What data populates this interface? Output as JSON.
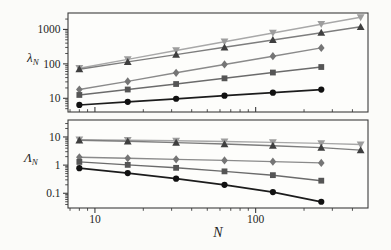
{
  "figure": {
    "background": "#fbfbf9",
    "frame_color": "#3c3c3c",
    "tick_color": "#3c3c3c",
    "text_color": "#1f1f1f"
  },
  "labels": {
    "top_y_symbol": "λ",
    "top_y_sub": "N",
    "bottom_y_symbol": "Λ",
    "bottom_y_sub": "N",
    "x_label": "N"
  },
  "chart_data": [
    {
      "type": "line",
      "panel": "top",
      "title": "",
      "xlabel": "",
      "ylabel": "lambda_N",
      "xscale": "log",
      "yscale": "log",
      "xlim": [
        6.8,
        500
      ],
      "ylim": [
        4,
        3000
      ],
      "grid": false,
      "legend": "none",
      "x_major_ticks": [
        10,
        100
      ],
      "x_tick_labels": [
        "",
        ""
      ],
      "x_tick_side": "in",
      "y_major_ticks": [
        10,
        100,
        1000
      ],
      "y_tick_labels": [
        "10",
        "100",
        "1000"
      ],
      "series": [
        {
          "name": "triangle-down-series",
          "marker": "triangle-down",
          "line_color": "#a8a8a8",
          "marker_color": "#9d9d9d",
          "x": [
            8,
            16,
            32,
            64,
            128,
            256,
            450
          ],
          "y": [
            75,
            135,
            245,
            440,
            790,
            1420,
            2250
          ]
        },
        {
          "name": "triangle-up-series",
          "marker": "triangle-up",
          "line_color": "#7d7d7d",
          "marker_color": "#3f3f3f",
          "x": [
            8,
            16,
            32,
            64,
            128,
            256,
            450
          ],
          "y": [
            70,
            114,
            186,
            303,
            494,
            806,
            1190
          ]
        },
        {
          "name": "diamond-series",
          "marker": "diamond",
          "line_color": "#8a8a8a",
          "marker_color": "#757575",
          "x": [
            8,
            16,
            32,
            64,
            128,
            256
          ],
          "y": [
            18,
            31,
            55,
            96,
            167,
            290
          ]
        },
        {
          "name": "square-series",
          "marker": "square",
          "line_color": "#6b6b6b",
          "marker_color": "#555555",
          "x": [
            8,
            16,
            32,
            64,
            128,
            256
          ],
          "y": [
            12.5,
            18,
            26,
            38,
            56,
            81
          ]
        },
        {
          "name": "circle-series",
          "marker": "circle",
          "line_color": "#1c1c1c",
          "marker_color": "#111111",
          "x": [
            8,
            16,
            32,
            64,
            128,
            256
          ],
          "y": [
            6.4,
            7.9,
            9.7,
            11.9,
            14.6,
            17.9
          ]
        }
      ]
    },
    {
      "type": "line",
      "panel": "bottom",
      "title": "",
      "xlabel": "N",
      "ylabel": "Lambda_N",
      "xscale": "log",
      "yscale": "log",
      "xlim": [
        6.8,
        500
      ],
      "ylim": [
        0.03,
        40
      ],
      "grid": false,
      "legend": "none",
      "x_major_ticks": [
        10,
        100
      ],
      "x_tick_labels": [
        "10",
        "100"
      ],
      "x_tick_side": "out",
      "y_major_ticks": [
        0.1,
        1,
        10
      ],
      "y_tick_labels": [
        "0.1",
        "1",
        "10"
      ],
      "series": [
        {
          "name": "triangle-down-series",
          "marker": "triangle-down",
          "line_color": "#a8a8a8",
          "marker_color": "#9d9d9d",
          "x": [
            8,
            16,
            32,
            64,
            128,
            256,
            450
          ],
          "y": [
            8.0,
            7.7,
            7.3,
            6.9,
            6.4,
            5.9,
            5.4
          ]
        },
        {
          "name": "triangle-up-series",
          "marker": "triangle-up",
          "line_color": "#7d7d7d",
          "marker_color": "#3f3f3f",
          "x": [
            8,
            16,
            32,
            64,
            128,
            256,
            450
          ],
          "y": [
            7.6,
            7.0,
            6.3,
            5.6,
            4.9,
            4.2,
            3.4
          ]
        },
        {
          "name": "diamond-series",
          "marker": "diamond",
          "line_color": "#8a8a8a",
          "marker_color": "#757575",
          "x": [
            8,
            16,
            32,
            64,
            128,
            256
          ],
          "y": [
            1.9,
            1.75,
            1.6,
            1.47,
            1.33,
            1.2
          ]
        },
        {
          "name": "square-series",
          "marker": "square",
          "line_color": "#6b6b6b",
          "marker_color": "#555555",
          "x": [
            8,
            16,
            32,
            64,
            128,
            256
          ],
          "y": [
            1.3,
            1.02,
            0.8,
            0.6,
            0.44,
            0.28
          ]
        },
        {
          "name": "circle-series",
          "marker": "circle",
          "line_color": "#1c1c1c",
          "marker_color": "#111111",
          "x": [
            8,
            16,
            32,
            64,
            128,
            256
          ],
          "y": [
            0.78,
            0.52,
            0.33,
            0.2,
            0.11,
            0.05
          ]
        }
      ]
    }
  ]
}
